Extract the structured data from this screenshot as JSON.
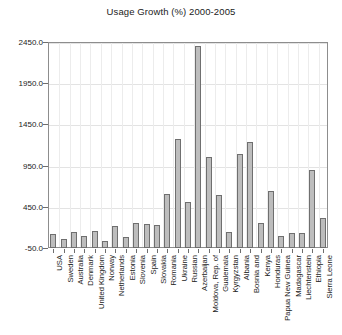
{
  "chart_data": {
    "type": "bar",
    "title": "Usage Growth (%) 2000-2005",
    "xlabel": "",
    "ylabel": "",
    "ylim": [
      -50.0,
      2450.0
    ],
    "yticks": [
      -50.0,
      450.0,
      950.0,
      1450.0,
      1950.0,
      2450.0
    ],
    "ytick_labels": [
      "-50.0",
      "450.0",
      "950.0",
      "1450.0",
      "1950.0",
      "2450.0"
    ],
    "grid": true,
    "legend": "none",
    "bar_color": "#bdbdbd",
    "bar_edge_color": "#6f6f6f",
    "categories": [
      "USA",
      "Sweden",
      "Australia",
      "Denmark",
      "United Kingdom",
      "Norway",
      "Netherlands",
      "Estonia",
      "Slovenia",
      "Spain",
      "Slovakia",
      "Romania",
      "Ukraine",
      "Russian",
      "Azerbaijan",
      "Moldova, Rep. of",
      "Gualemala",
      "Kyrgyzstan",
      "Albania",
      "Bosnia and",
      "Kenya",
      "Honduras",
      "Papua New Guinea",
      "Madagascar",
      "Liechtenstein",
      "Ethiopia",
      "Sierra Leone"
    ],
    "values": [
      120,
      60,
      140,
      90,
      160,
      40,
      220,
      80,
      250,
      240,
      230,
      600,
      1270,
      510,
      2400,
      1050,
      590,
      140,
      1090,
      1240,
      250,
      640,
      95,
      130,
      135,
      900,
      315
    ]
  }
}
